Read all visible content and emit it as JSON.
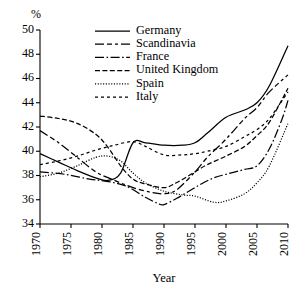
{
  "chart_data": {
    "type": "line",
    "title": "",
    "xlabel": "Year",
    "ylabel": "",
    "unit_label": "%",
    "xlim": [
      1970,
      2010
    ],
    "ylim": [
      34,
      50
    ],
    "xticks": [
      1970,
      1975,
      1980,
      1985,
      1990,
      1995,
      2000,
      2005,
      2010
    ],
    "yticks": [
      34,
      36,
      38,
      40,
      42,
      44,
      46,
      48,
      50
    ],
    "grid": false,
    "legend_position": "top-center",
    "x": [
      1970,
      1975,
      1980,
      1985,
      1990,
      1995,
      2000,
      2005,
      2010
    ],
    "series": [
      {
        "name": "Germany",
        "dash": "solid",
        "values": [
          39.8,
          38.6,
          37.7,
          40.7,
          40.5,
          40.6,
          42.8,
          44.0,
          48.7
        ],
        "points": [
          [
            1970,
            39.8
          ],
          [
            1973,
            39.1
          ],
          [
            1976,
            38.4
          ],
          [
            1979,
            37.8
          ],
          [
            1981,
            37.6
          ],
          [
            1983,
            38.2
          ],
          [
            1985,
            40.7
          ],
          [
            1987,
            40.7
          ],
          [
            1990,
            40.5
          ],
          [
            1993,
            40.5
          ],
          [
            1995,
            40.7
          ],
          [
            1997,
            41.5
          ],
          [
            2000,
            42.8
          ],
          [
            2003,
            43.4
          ],
          [
            2005,
            44.0
          ],
          [
            2007,
            45.4
          ],
          [
            2010,
            48.7
          ]
        ]
      },
      {
        "name": "Scandinavia",
        "dash": "long-dash-dot-dash",
        "values": [
          41.7,
          39.9,
          38.0,
          37.0,
          36.5,
          38.3,
          41.0,
          43.6,
          46.3
        ],
        "points": [
          [
            1970,
            41.7
          ],
          [
            1973,
            40.7
          ],
          [
            1976,
            39.5
          ],
          [
            1979,
            38.3
          ],
          [
            1982,
            37.6
          ],
          [
            1985,
            37.0
          ],
          [
            1988,
            36.6
          ],
          [
            1990,
            36.5
          ],
          [
            1992,
            36.8
          ],
          [
            1995,
            38.3
          ],
          [
            1997,
            39.5
          ],
          [
            2000,
            41.0
          ],
          [
            2003,
            42.7
          ],
          [
            2005,
            43.6
          ],
          [
            2007,
            44.9
          ],
          [
            2010,
            46.3
          ]
        ]
      },
      {
        "name": "France",
        "dash": "dash-dot",
        "values": [
          38.3,
          37.9,
          37.5,
          36.8,
          35.6,
          36.9,
          38.1,
          38.8,
          44.2
        ],
        "points": [
          [
            1970,
            38.3
          ],
          [
            1974,
            38.1
          ],
          [
            1978,
            37.7
          ],
          [
            1981,
            37.5
          ],
          [
            1984,
            37.1
          ],
          [
            1987,
            36.2
          ],
          [
            1989,
            35.7
          ],
          [
            1990,
            35.6
          ],
          [
            1992,
            36.1
          ],
          [
            1994,
            36.7
          ],
          [
            1996,
            37.3
          ],
          [
            1998,
            37.8
          ],
          [
            2000,
            38.1
          ],
          [
            2003,
            38.5
          ],
          [
            2005,
            38.8
          ],
          [
            2007,
            40.2
          ],
          [
            2009,
            42.6
          ],
          [
            2010,
            44.2
          ]
        ]
      },
      {
        "name": "United Kingdom",
        "dash": "medium-dash",
        "values": [
          42.9,
          42.4,
          41.0,
          37.7,
          37.0,
          38.3,
          39.6,
          41.3,
          45.2
        ],
        "points": [
          [
            1970,
            42.9
          ],
          [
            1973,
            42.7
          ],
          [
            1976,
            42.3
          ],
          [
            1979,
            41.4
          ],
          [
            1981,
            40.3
          ],
          [
            1983,
            38.8
          ],
          [
            1985,
            37.7
          ],
          [
            1987,
            37.3
          ],
          [
            1990,
            37.0
          ],
          [
            1992,
            37.4
          ],
          [
            1995,
            38.3
          ],
          [
            1997,
            38.9
          ],
          [
            2000,
            39.6
          ],
          [
            2003,
            40.4
          ],
          [
            2005,
            41.3
          ],
          [
            2007,
            42.4
          ],
          [
            2010,
            45.2
          ]
        ]
      },
      {
        "name": "Spain",
        "dash": "dotted",
        "values": [
          37.9,
          38.6,
          39.6,
          38.2,
          36.7,
          36.3,
          35.8,
          37.4,
          42.3
        ],
        "points": [
          [
            1970,
            37.9
          ],
          [
            1973,
            38.2
          ],
          [
            1976,
            38.8
          ],
          [
            1979,
            39.5
          ],
          [
            1981,
            39.6
          ],
          [
            1983,
            39.2
          ],
          [
            1985,
            38.2
          ],
          [
            1987,
            37.4
          ],
          [
            1990,
            36.7
          ],
          [
            1993,
            36.4
          ],
          [
            1995,
            36.3
          ],
          [
            1998,
            35.8
          ],
          [
            2000,
            35.9
          ],
          [
            2003,
            36.5
          ],
          [
            2005,
            37.4
          ],
          [
            2007,
            38.8
          ],
          [
            2010,
            42.3
          ]
        ]
      },
      {
        "name": "Italy",
        "dash": "short-dash",
        "values": [
          38.9,
          39.4,
          40.2,
          40.8,
          39.7,
          39.7,
          40.4,
          41.8,
          44.9
        ],
        "points": [
          [
            1970,
            38.9
          ],
          [
            1973,
            39.2
          ],
          [
            1976,
            39.6
          ],
          [
            1979,
            40.1
          ],
          [
            1982,
            40.5
          ],
          [
            1985,
            40.8
          ],
          [
            1987,
            40.4
          ],
          [
            1990,
            39.7
          ],
          [
            1993,
            39.7
          ],
          [
            1995,
            39.8
          ],
          [
            1997,
            40.0
          ],
          [
            2000,
            40.4
          ],
          [
            2003,
            41.2
          ],
          [
            2005,
            41.8
          ],
          [
            2007,
            42.7
          ],
          [
            2010,
            44.9
          ]
        ]
      }
    ],
    "legend": [
      {
        "label": "Germany",
        "dash": "solid"
      },
      {
        "label": "Scandinavia",
        "dash": "long-dash-dot-dash"
      },
      {
        "label": "France",
        "dash": "dash-dot"
      },
      {
        "label": "United Kingdom",
        "dash": "medium-dash"
      },
      {
        "label": "Spain",
        "dash": "dotted"
      },
      {
        "label": "Italy",
        "dash": "short-dash"
      }
    ]
  }
}
